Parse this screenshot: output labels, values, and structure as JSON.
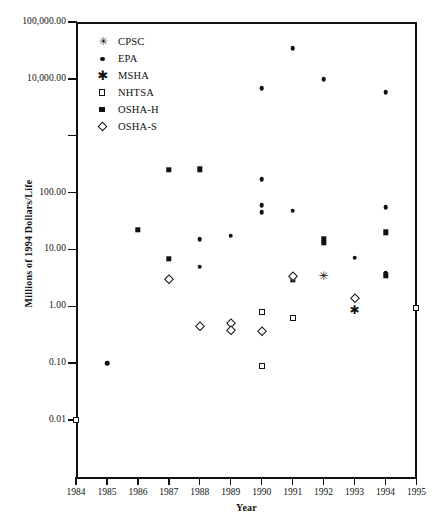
{
  "chart_data": {
    "type": "scatter",
    "title": "",
    "xlabel": "Year",
    "ylabel": "Millions of 1994 Dollars/Life",
    "xlim": [
      1984,
      1995
    ],
    "ylim": [
      0.01,
      100000
    ],
    "yscale": "log",
    "grid": false,
    "legend_position": "top-left-inside",
    "x_ticks": [
      "1984",
      "1985",
      "1986",
      "1987",
      "1988",
      "1989",
      "1990",
      "1991",
      "1992",
      "1993",
      "1994",
      "1995"
    ],
    "y_ticks": [
      "100,000.00",
      "10,000.00",
      "",
      "100.00",
      "10.00",
      "1.00",
      "0.10",
      "0.01"
    ],
    "y_tick_values": [
      100000,
      10000,
      1000,
      100,
      10,
      1,
      0.1,
      0.01
    ],
    "series": [
      {
        "name": "CPSC",
        "marker": "asterisk-6",
        "points": [
          {
            "x": 1992,
            "y": 3.4
          }
        ]
      },
      {
        "name": "EPA",
        "marker": "filled-circle",
        "points": [
          {
            "x": 1985,
            "y": 0.1
          },
          {
            "x": 1988,
            "y": 15.0
          },
          {
            "x": 1988,
            "y": 5.0
          },
          {
            "x": 1989,
            "y": 17.5
          },
          {
            "x": 1990,
            "y": 6800
          },
          {
            "x": 1990,
            "y": 170
          },
          {
            "x": 1990,
            "y": 60
          },
          {
            "x": 1990,
            "y": 45
          },
          {
            "x": 1991,
            "y": 35000
          },
          {
            "x": 1991,
            "y": 48
          },
          {
            "x": 1992,
            "y": 9800
          },
          {
            "x": 1993,
            "y": 7.2
          },
          {
            "x": 1994,
            "y": 5800
          },
          {
            "x": 1994,
            "y": 55
          },
          {
            "x": 1994,
            "y": 3.8
          }
        ]
      },
      {
        "name": "MSHA",
        "marker": "asterisk-8",
        "points": [
          {
            "x": 1993,
            "y": 0.85
          }
        ]
      },
      {
        "name": "NHTSA",
        "marker": "open-square",
        "points": [
          {
            "x": 1984,
            "y": 0.01
          },
          {
            "x": 1990,
            "y": 0.78
          },
          {
            "x": 1990,
            "y": 0.09
          },
          {
            "x": 1991,
            "y": 0.62
          },
          {
            "x": 1995,
            "y": 0.95
          }
        ]
      },
      {
        "name": "OSHA-H",
        "marker": "filled-square",
        "points": [
          {
            "x": 1986,
            "y": 22
          },
          {
            "x": 1987,
            "y": 250
          },
          {
            "x": 1987,
            "y": 6.8
          },
          {
            "x": 1988,
            "y": 255
          },
          {
            "x": 1991,
            "y": 3.0
          },
          {
            "x": 1992,
            "y": 15.5
          },
          {
            "x": 1992,
            "y": 13.0
          },
          {
            "x": 1994,
            "y": 20
          },
          {
            "x": 1994,
            "y": 3.5
          }
        ]
      },
      {
        "name": "OSHA-S",
        "marker": "open-diamond",
        "points": [
          {
            "x": 1987,
            "y": 3.0
          },
          {
            "x": 1988,
            "y": 0.45
          },
          {
            "x": 1989,
            "y": 0.5
          },
          {
            "x": 1989,
            "y": 0.38
          },
          {
            "x": 1990,
            "y": 0.37
          },
          {
            "x": 1991,
            "y": 3.4
          },
          {
            "x": 1993,
            "y": 1.4
          }
        ]
      }
    ]
  },
  "legend": {
    "items": [
      {
        "label": "CPSC",
        "marker": "asterisk-6"
      },
      {
        "label": "EPA",
        "marker": "filled-circle"
      },
      {
        "label": "MSHA",
        "marker": "asterisk-8"
      },
      {
        "label": "NHTSA",
        "marker": "open-square"
      },
      {
        "label": "OSHA-H",
        "marker": "filled-square"
      },
      {
        "label": "OSHA-S",
        "marker": "open-diamond"
      }
    ]
  },
  "axes": {
    "y_title": "Millions of 1994 Dollars/Life",
    "x_title": "Year"
  },
  "colors": {
    "ink": "#111111",
    "background": "#ffffff"
  }
}
